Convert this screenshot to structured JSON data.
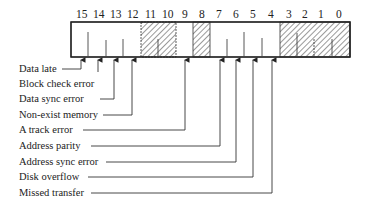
{
  "register": {
    "bits": [
      "15",
      "14",
      "13",
      "12",
      "11",
      "10",
      "9",
      "8",
      "7",
      "6",
      "5",
      "4",
      "3",
      "2",
      "1",
      "0"
    ],
    "unused_bits": [
      "11",
      "10",
      "8",
      "3",
      "2",
      "1",
      "0"
    ]
  },
  "fields": [
    {
      "bit": "15",
      "label": "Data late"
    },
    {
      "bit": "14",
      "label": "Block check error"
    },
    {
      "bit": "13",
      "label": "Data sync error"
    },
    {
      "bit": "12",
      "label": "Non-exist memory"
    },
    {
      "bit": "9",
      "label": "A track error"
    },
    {
      "bit": "7",
      "label": "Address parity"
    },
    {
      "bit": "6",
      "label": "Address sync error"
    },
    {
      "bit": "5",
      "label": "Disk overflow"
    },
    {
      "bit": "4",
      "label": "Missed transfer"
    }
  ]
}
